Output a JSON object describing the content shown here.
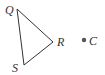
{
  "diagram": {
    "type": "geometry",
    "triangle": {
      "vertices": [
        {
          "name": "Q",
          "x": 17,
          "y": 9
        },
        {
          "name": "R",
          "x": 53,
          "y": 42
        },
        {
          "name": "S",
          "x": 24,
          "y": 65
        }
      ],
      "stroke": "#333333"
    },
    "point": {
      "name": "C",
      "x": 84,
      "y": 40,
      "color": "#555555"
    },
    "labels": {
      "Q": "Q",
      "R": "R",
      "S": "S",
      "C": "C"
    }
  }
}
